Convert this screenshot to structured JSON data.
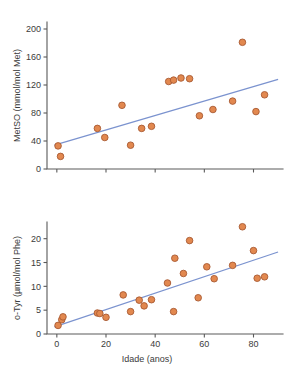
{
  "figure": {
    "background_color": "#ffffff",
    "marker_fill": "#e2884f",
    "marker_stroke": "#a85a33",
    "trend_color": "#7b93cf",
    "axis_color": "#5a5a5a",
    "text_color": "#3b3b3b"
  },
  "chart_data": [
    {
      "type": "scatter",
      "panel": "top",
      "title": "",
      "xlabel": "",
      "ylabel": "MetSO (mmol/mol Met)",
      "xlim": [
        -4,
        92
      ],
      "ylim": [
        0,
        210
      ],
      "xticks": [
        0,
        20,
        40,
        60,
        80
      ],
      "xticklabels": [
        "",
        "",
        "",
        "",
        ""
      ],
      "yticks": [
        0,
        40,
        80,
        120,
        160,
        200
      ],
      "yticklabels": [
        "0",
        "40",
        "80",
        "120",
        "160",
        "200"
      ],
      "grid": false,
      "legend": "none",
      "series": [
        {
          "name": "MetSO vs Idade",
          "marker": "circle",
          "x": [
            0.5,
            1.5,
            16.5,
            19.5,
            26.5,
            30.0,
            34.5,
            38.5,
            45.5,
            47.5,
            50.5,
            54.0,
            58.0,
            63.5,
            71.5,
            75.5,
            81.0,
            84.5
          ],
          "y": [
            33,
            18,
            58,
            45,
            91,
            34,
            58,
            61,
            125,
            127,
            130,
            129,
            76,
            85,
            97,
            181,
            82,
            106
          ]
        }
      ],
      "trendline": {
        "name": "linear fit",
        "x": [
          -1,
          90
        ],
        "y": [
          34,
          128
        ]
      }
    },
    {
      "type": "scatter",
      "panel": "bottom",
      "title": "",
      "xlabel": "Idade (anos)",
      "ylabel": "o-Tyr (µmol/mol Phe)",
      "xlim": [
        -4,
        92
      ],
      "ylim": [
        0,
        23.5
      ],
      "xticks": [
        0,
        20,
        40,
        60,
        80
      ],
      "xticklabels": [
        "0",
        "20",
        "40",
        "60",
        "80"
      ],
      "yticks": [
        0,
        5,
        10,
        15,
        20
      ],
      "yticklabels": [
        "0",
        "5",
        "10",
        "15",
        "20"
      ],
      "grid": false,
      "legend": "none",
      "series": [
        {
          "name": "o-Tyr vs Idade",
          "marker": "circle",
          "x": [
            0.5,
            2.0,
            2.5,
            16.5,
            17.5,
            20.0,
            27.0,
            30.0,
            33.5,
            35.5,
            38.5,
            45.0,
            47.5,
            48.0,
            51.5,
            54.0,
            57.5,
            61.0,
            64.0,
            71.5,
            75.5,
            80.0,
            81.5,
            84.5
          ],
          "y": [
            1.8,
            3.0,
            3.6,
            4.4,
            4.3,
            3.5,
            8.2,
            4.7,
            7.1,
            5.9,
            7.2,
            10.7,
            4.7,
            15.9,
            12.7,
            19.6,
            7.6,
            14.1,
            11.6,
            14.4,
            22.5,
            17.5,
            11.7,
            12.0
          ]
        }
      ],
      "trendline": {
        "name": "linear fit",
        "x": [
          -1,
          90
        ],
        "y": [
          1.5,
          17.2
        ]
      }
    }
  ]
}
